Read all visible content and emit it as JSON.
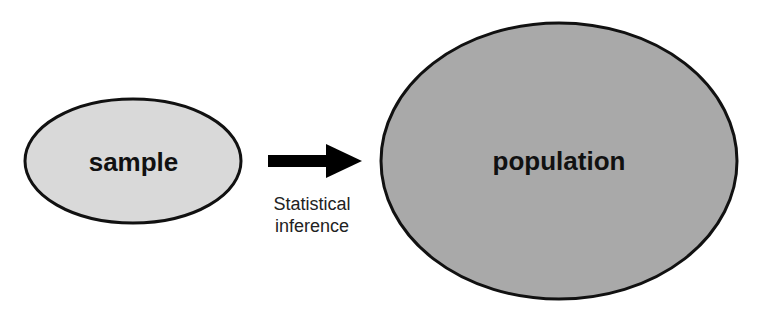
{
  "diagram": {
    "nodes": [
      {
        "id": "sample",
        "label": "sample",
        "fill": "#d9d9d9",
        "stroke": "#111111"
      },
      {
        "id": "population",
        "label": "population",
        "fill": "#a9a9a9",
        "stroke": "#111111"
      }
    ],
    "edges": [
      {
        "from": "sample",
        "to": "population",
        "label_line1": "Statistical",
        "label_line2": "inference",
        "color": "#000000"
      }
    ]
  }
}
